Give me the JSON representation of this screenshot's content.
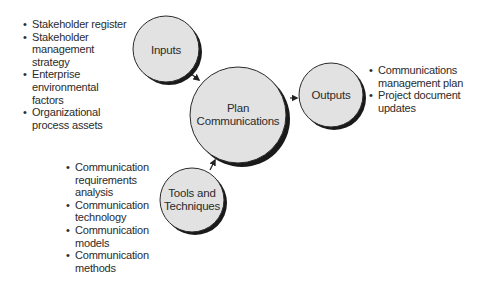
{
  "diagram": {
    "colors": {
      "circle_fill": "#e2e2e2",
      "circle_stroke": "#2a2a2a",
      "shadow": "#1a1a1a",
      "text": "#2b2b2b",
      "arrow": "#222222"
    },
    "nodes": {
      "inputs": {
        "label": "Inputs"
      },
      "process": {
        "line1": "Plan",
        "line2": "Communications"
      },
      "outputs": {
        "label": "Outputs"
      },
      "tools": {
        "line1": "Tools and",
        "line2": "Techniques"
      }
    },
    "bullet": "•",
    "inputs_list": [
      {
        "line1": "Stakeholder register"
      },
      {
        "line1": "Stakeholder",
        "line2": "management",
        "line3": "strategy"
      },
      {
        "line1": "Enterprise",
        "line2": "environmental",
        "line3": "factors"
      },
      {
        "line1": "Organizational",
        "line2": "process assets"
      }
    ],
    "outputs_list": [
      {
        "line1": "Communications",
        "line2": "management plan"
      },
      {
        "line1": "Project document",
        "line2": "updates"
      }
    ],
    "tools_list": [
      {
        "line1": "Communication",
        "line2": "requirements",
        "line3": "analysis"
      },
      {
        "line1": "Communication",
        "line2": "technology"
      },
      {
        "line1": "Communication",
        "line2": "models"
      },
      {
        "line1": "Communication",
        "line2": "methods"
      }
    ]
  }
}
